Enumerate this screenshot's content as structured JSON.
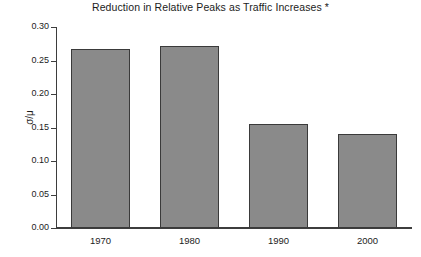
{
  "chart_data": {
    "type": "bar",
    "title": "Reduction in Relative Peaks as Traffic Increases *",
    "xlabel": "",
    "ylabel": "σ/μ",
    "categories": [
      "1970",
      "1980",
      "1990",
      "2000"
    ],
    "values": [
      0.267,
      0.271,
      0.155,
      0.14
    ],
    "ylim": [
      0.0,
      0.3
    ],
    "ytick_labels": [
      "0.30",
      "0.25",
      "0.20",
      "0.15",
      "0.10",
      "0.05",
      "0.00"
    ],
    "ytick_values": [
      0.3,
      0.25,
      0.2,
      0.15,
      0.1,
      0.05,
      0.0
    ],
    "grid": false,
    "legend": null,
    "bar_color": "#8a8a8a",
    "bar_edge_color": "#3a3a3a",
    "axis_color": "#3d3d3d",
    "background_color": "#ffffff",
    "annotations": [
      "*"
    ]
  }
}
